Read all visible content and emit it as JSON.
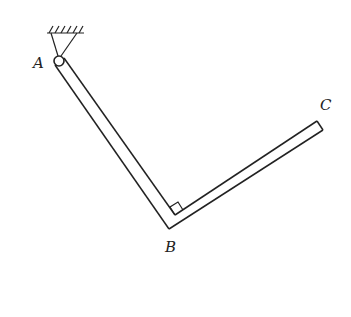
{
  "diagram": {
    "type": "mechanics-figure",
    "labels": {
      "A": "A",
      "B": "B",
      "C": "C"
    },
    "elements": [
      {
        "name": "fixed-support",
        "at": "A"
      },
      {
        "name": "pin-joint",
        "at": "A"
      },
      {
        "name": "bar-segment",
        "from": "A",
        "to": "B"
      },
      {
        "name": "bar-segment",
        "from": "B",
        "to": "C"
      },
      {
        "name": "right-angle-marker",
        "at": "B"
      }
    ],
    "colors": {
      "line": "#222222",
      "background": "#ffffff"
    }
  }
}
